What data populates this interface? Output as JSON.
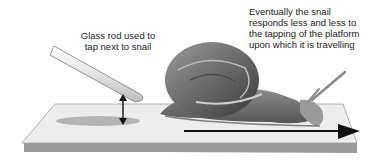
{
  "annotations": {
    "rod_label": [
      "Glass rod used to",
      "tap next to snail"
    ],
    "snail_label": [
      "Eventually the snail",
      "responds less and less to",
      "the tapping of the platform",
      "upon which it is travelling"
    ]
  },
  "elements": {
    "glass_rod": "glass-rod",
    "snail": "snail",
    "platform": "platform",
    "tap_arrow": "double-headed-arrow",
    "direction_arrow": "direction-arrow"
  },
  "colors": {
    "platform_top": "#ededed",
    "platform_edge": "#9a9a9a",
    "tap_spot": "#b4b4b4",
    "arrow": "#111111",
    "snail_shell": "#6e6e6e",
    "snail_body": "#8a8a8a",
    "text": "#222222"
  }
}
